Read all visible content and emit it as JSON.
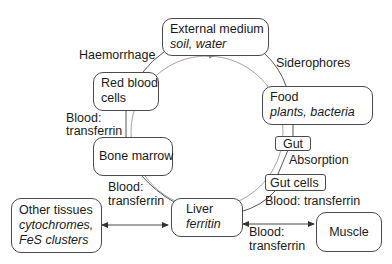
{
  "diagram": {
    "nodes": {
      "external_medium": {
        "title": "External medium",
        "subtitle": "soil, water"
      },
      "red_blood_cells": {
        "line1": "Red blood",
        "line2": "cells"
      },
      "food": {
        "title": "Food",
        "subtitle": "plants, bacteria"
      },
      "gut": {
        "title": "Gut"
      },
      "gut_cells": {
        "title": "Gut cells"
      },
      "bone_marrow": {
        "title": "Bone marrow"
      },
      "liver": {
        "title": "Liver",
        "subtitle": "ferritin"
      },
      "other_tissues": {
        "title": "Other tissues",
        "subtitle1": "cytochromes,",
        "subtitle2": "FeS clusters"
      },
      "muscle": {
        "title": "Muscle"
      }
    },
    "edge_labels": {
      "haemorrhage": "Haemorrhage",
      "siderophores": "Siderophores",
      "absorption": "Absorption",
      "rbc_bone_l1": "Blood:",
      "rbc_bone_l2": "transferrin",
      "bone_liver_l1": "Blood:",
      "bone_liver_l2": "transferrin",
      "gutcells_liver": "Blood: transferrin",
      "liver_muscle_l1": "Blood:",
      "liver_muscle_l2": "transferrin"
    }
  }
}
